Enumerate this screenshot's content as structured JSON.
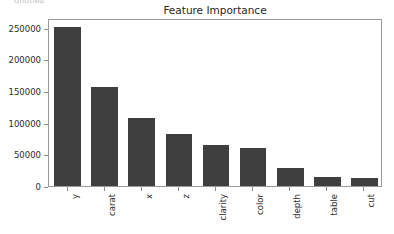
{
  "figure": {
    "top_clipped_text": "Untitled",
    "background_color": "#ffffff",
    "frame_color": "#9a9a9a",
    "bar_color": "#3f3f3f",
    "text_color": "#2b2b2b"
  },
  "chart_data": {
    "type": "bar",
    "title": "Feature Importance",
    "xlabel": "",
    "ylabel": "",
    "categories": [
      "y",
      "carat",
      "x",
      "z",
      "clarity",
      "color",
      "depth",
      "table",
      "cut"
    ],
    "values": [
      251000,
      155700,
      107000,
      81800,
      64500,
      59700,
      28300,
      14100,
      13100
    ],
    "ylim": [
      0,
      265000
    ],
    "yticks": [
      0,
      50000,
      100000,
      150000,
      200000,
      250000
    ],
    "ytick_labels": [
      "0",
      "50000",
      "100000",
      "150000",
      "200000",
      "250000"
    ],
    "xtick_labels": [
      "y",
      "carat",
      "x",
      "z",
      "clarity",
      "color",
      "depth",
      "table",
      "cut"
    ],
    "xtick_rotation": 90,
    "grid": false,
    "legend": null,
    "series": [
      {
        "name": "importance",
        "values": [
          251000,
          155700,
          107000,
          81800,
          64500,
          59700,
          28300,
          14100,
          13100
        ]
      }
    ]
  }
}
